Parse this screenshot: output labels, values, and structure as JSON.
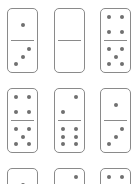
{
  "puzzle": {
    "pip_color": "#707070",
    "border_color": "#8a8a8a",
    "dominoes": [
      {
        "row": 0,
        "col": 0,
        "top": 1,
        "bottom": 3
      },
      {
        "row": 0,
        "col": 1,
        "top": 0,
        "bottom": 0
      },
      {
        "row": 0,
        "col": 2,
        "top": 4,
        "bottom": 5
      },
      {
        "row": 1,
        "col": 0,
        "top": 4,
        "bottom": 5
      },
      {
        "row": 1,
        "col": 1,
        "top": 2,
        "bottom": 6
      },
      {
        "row": 1,
        "col": 2,
        "top": 1,
        "bottom": 3
      },
      {
        "row": 2,
        "col": 0,
        "top": 1,
        "bottom": null
      },
      {
        "row": 2,
        "col": 1,
        "top": 2,
        "bottom": null
      },
      {
        "row": 2,
        "col": 2,
        "top": 4,
        "bottom": null
      }
    ]
  }
}
